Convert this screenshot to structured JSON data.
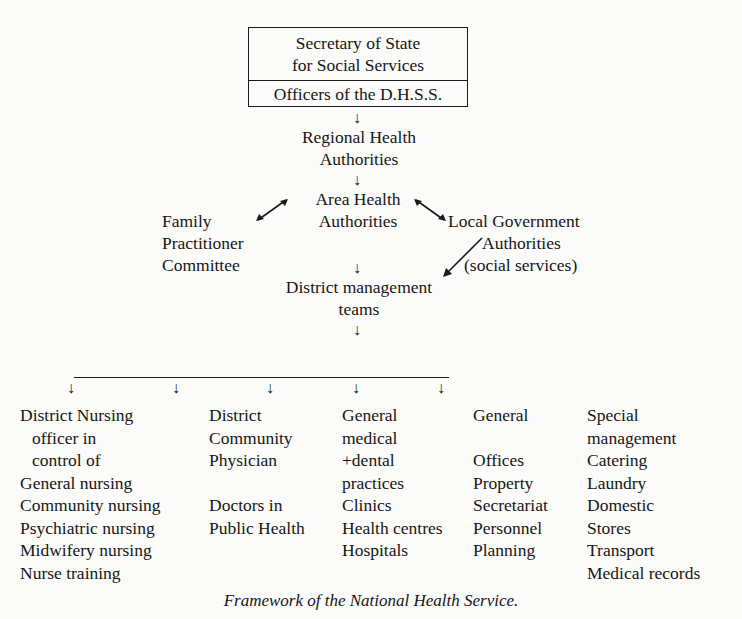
{
  "page": {
    "running_header": "(cropped, illegible)"
  },
  "chart_top": {
    "box": {
      "line1": "Secretary of State",
      "line2": "for Social Services",
      "line3": "Officers of the D.H.S.S."
    },
    "regional": {
      "line1": "Regional Health",
      "line2": "Authorities"
    },
    "area": {
      "line1": "Area Health",
      "line2": "Authorities"
    },
    "family": {
      "line1": "Family",
      "line2": "Practitioner",
      "line3": "Committee"
    },
    "local_gov": {
      "line1": "Local Government",
      "line2": "Authorities",
      "line3": "(social services)"
    },
    "district_mgmt": {
      "line1": "District management",
      "line2": "teams"
    }
  },
  "branches": [
    {
      "title": [
        "District Nursing",
        "officer in",
        "control of"
      ],
      "items": [
        "General nursing",
        "Community nursing",
        "Psychiatric nursing",
        "Midwifery nursing",
        "Nurse training"
      ]
    },
    {
      "title": [
        "District",
        "Community",
        "Physician"
      ],
      "items": [
        "",
        "Doctors in",
        "Public Health"
      ]
    },
    {
      "title": [
        "General",
        "medical",
        "+dental",
        "practices"
      ],
      "items": [
        "Clinics",
        "Health centres",
        "Hospitals"
      ]
    },
    {
      "title": [
        "General",
        ""
      ],
      "items": [
        "Offices",
        "Property",
        "Secretariat",
        "Personnel",
        "Planning"
      ]
    },
    {
      "title": [
        "Special",
        "management"
      ],
      "items": [
        "Catering",
        "Laundry",
        "Domestic",
        "Stores",
        "Transport",
        "Medical records"
      ]
    }
  ],
  "arrows": {
    "down": "↓",
    "up_right": "↗",
    "down_left": "↙",
    "up_left": "↖",
    "down_right": "↘"
  },
  "caption": "Framework of the National Health Service."
}
